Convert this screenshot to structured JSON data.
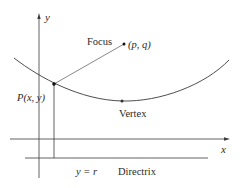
{
  "diagram": {
    "axes": {
      "x_label": "x",
      "y_label": "y"
    },
    "labels": {
      "focus": "Focus",
      "focus_coords": "(p, q)",
      "point": "P(x, y)",
      "vertex": "Vertex",
      "directrix_eq": "y = r",
      "directrix": "Directrix"
    },
    "colors": {
      "line": "#3a3a3a",
      "text": "#2a2a2a",
      "background": "#ffffff"
    }
  }
}
